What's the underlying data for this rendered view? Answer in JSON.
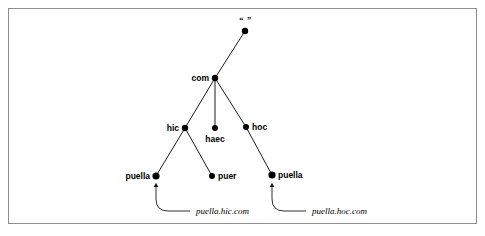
{
  "figure": {
    "kind": "dns-namespace-tree-diagram",
    "border_color": "#8d8d8d",
    "background_color": "#ffffff",
    "line_color": "#1a1a1a",
    "node_color": "#000000"
  },
  "nodes": [
    {
      "id": "root",
      "label": "“ ”",
      "x": 245,
      "y": 31,
      "r": 3.2,
      "anchor": "above",
      "dx": 0,
      "dy": -6,
      "style": "root"
    },
    {
      "id": "com",
      "label": "com",
      "x": 215,
      "y": 78,
      "r": 3.2,
      "anchor": "right",
      "dx": -6,
      "dy": 0,
      "style": "bold"
    },
    {
      "id": "hic",
      "label": "hic",
      "x": 185,
      "y": 128,
      "r": 3.2,
      "anchor": "right",
      "dx": -6,
      "dy": 0,
      "style": "bold"
    },
    {
      "id": "haec",
      "label": "haec",
      "x": 215,
      "y": 128,
      "r": 3.0,
      "anchor": "below",
      "dx": 0,
      "dy": 7,
      "style": "bold"
    },
    {
      "id": "hoc",
      "label": "hoc",
      "x": 246,
      "y": 127,
      "r": 3.0,
      "anchor": "left",
      "dx": 6,
      "dy": 0,
      "style": "bold"
    },
    {
      "id": "puella_hic",
      "label": "puella",
      "x": 156,
      "y": 176,
      "r": 3.6,
      "anchor": "right",
      "dx": -6,
      "dy": 0,
      "style": "bold"
    },
    {
      "id": "puer_hic",
      "label": "puer",
      "x": 212,
      "y": 176,
      "r": 3.0,
      "anchor": "left",
      "dx": 6,
      "dy": 0,
      "style": "bold"
    },
    {
      "id": "puella_hoc",
      "label": "puella",
      "x": 272,
      "y": 175,
      "r": 3.6,
      "anchor": "left",
      "dx": 6,
      "dy": 0,
      "style": "bold"
    }
  ],
  "edges": [
    {
      "from": "root",
      "to": "com"
    },
    {
      "from": "com",
      "to": "hic"
    },
    {
      "from": "com",
      "to": "haec"
    },
    {
      "from": "com",
      "to": "hoc"
    },
    {
      "from": "hic",
      "to": "puella_hic"
    },
    {
      "from": "hic",
      "to": "puer_hic"
    },
    {
      "from": "hoc",
      "to": "puella_hoc"
    }
  ],
  "annotations": [
    {
      "id": "ann-puella-hic",
      "text": "puella.hic.com",
      "target_node": "puella_hic",
      "text_x": 196,
      "text_y": 211,
      "path": "M 190 211 L 168 211 Q 156 211 156 199 L 156 185",
      "arrow_x": 156,
      "arrow_y": 182
    },
    {
      "id": "ann-puella-hoc",
      "text": "puella.hoc.com",
      "target_node": "puella_hoc",
      "text_x": 312,
      "text_y": 211,
      "path": "M 306 211 L 284 211 Q 272 211 272 199 L 272 185",
      "arrow_x": 272,
      "arrow_y": 182
    }
  ]
}
